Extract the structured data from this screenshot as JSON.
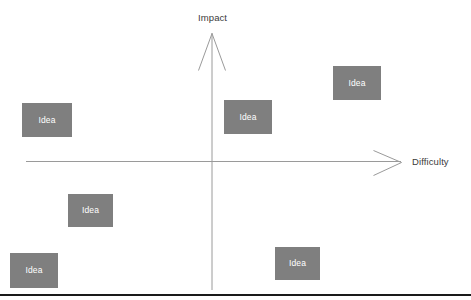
{
  "diagram": {
    "background_color": "#ffffff",
    "axes": {
      "vertical": {
        "label": "Impact",
        "direction": "up",
        "arrowhead": "open-v",
        "color": "#808080"
      },
      "horizontal": {
        "label": "Difficulty",
        "direction": "right",
        "arrowhead": "open-v",
        "color": "#808080"
      },
      "origin": {
        "x": 212,
        "y": 161
      }
    },
    "bottom_rule_color": "#1a1a1a",
    "box_style": {
      "fill": "#7f7f7f",
      "text_color": "#ffffff"
    },
    "boxes": [
      {
        "label": "Idea",
        "x": 22,
        "y": 103,
        "w": 50,
        "h": 34,
        "quadrant": "high-impact-low-difficulty"
      },
      {
        "label": "Idea",
        "x": 333,
        "y": 66,
        "w": 48,
        "h": 34,
        "quadrant": "high-impact-high-difficulty"
      },
      {
        "label": "Idea",
        "x": 224,
        "y": 100,
        "w": 48,
        "h": 34,
        "quadrant": "high-impact-high-difficulty"
      },
      {
        "label": "Idea",
        "x": 68,
        "y": 194,
        "w": 45,
        "h": 33,
        "quadrant": "low-impact-low-difficulty"
      },
      {
        "label": "Idea",
        "x": 10,
        "y": 253,
        "w": 48,
        "h": 35,
        "quadrant": "low-impact-low-difficulty"
      },
      {
        "label": "Idea",
        "x": 275,
        "y": 247,
        "w": 45,
        "h": 33,
        "quadrant": "low-impact-high-difficulty"
      }
    ]
  },
  "chart_data": {
    "type": "scatter",
    "title": "",
    "xlabel": "Difficulty",
    "ylabel": "Impact",
    "legend": [],
    "grid": false,
    "series": [
      {
        "name": "Idea",
        "points": [
          {
            "label": "Idea",
            "difficulty": "low",
            "impact": "high"
          },
          {
            "label": "Idea",
            "difficulty": "high",
            "impact": "high"
          },
          {
            "label": "Idea",
            "difficulty": "high",
            "impact": "high"
          },
          {
            "label": "Idea",
            "difficulty": "low",
            "impact": "low"
          },
          {
            "label": "Idea",
            "difficulty": "low",
            "impact": "low"
          },
          {
            "label": "Idea",
            "difficulty": "high",
            "impact": "low"
          }
        ]
      }
    ]
  }
}
